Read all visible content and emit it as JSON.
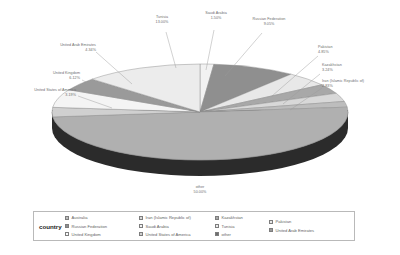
{
  "chart_data": {
    "type": "pie",
    "title": "",
    "legend_title": "country",
    "legend_position": "bottom",
    "three_d": true,
    "categories": [
      "Saudi Arabia",
      "Russian Federation",
      "Pakistan",
      "Kazakhstan",
      "Iran (Islamic Republic of)",
      "Australia",
      "other",
      "United States of America",
      "United Kingdom",
      "United Arab Emirates",
      "Tunisia"
    ],
    "values": [
      1.5,
      9.05,
      4.85,
      3.24,
      2.83,
      1.93,
      50.0,
      3.19,
      6.12,
      4.34,
      13.0
    ],
    "value_format": "percent",
    "labels": [
      {
        "name": "Saudi Arabia",
        "pct": "1.50%",
        "value": 1.5
      },
      {
        "name": "Russian Federation",
        "pct": "9.05%",
        "value": 9.05
      },
      {
        "name": "Pakistan",
        "pct": "4.85%",
        "value": 4.85
      },
      {
        "name": "Kazakhstan",
        "pct": "3.24%",
        "value": 3.24
      },
      {
        "name": "Iran (Islamic Republic of)",
        "pct": "2.83%",
        "value": 2.83
      },
      {
        "name": "other",
        "pct": "50.00%",
        "value": 50.0
      },
      {
        "name": "United States of America",
        "pct": "3.19%",
        "value": 3.19
      },
      {
        "name": "United Kingdom",
        "pct": "6.12%",
        "value": 6.12
      },
      {
        "name": "United Arab Emirates",
        "pct": "4.34%",
        "value": 4.34
      },
      {
        "name": "Tunisia",
        "pct": "13.00%",
        "value": 13.0
      }
    ],
    "slice_colors": [
      "#f2f2f2",
      "#8f8f8f",
      "#e8e8e8",
      "#a8a8a8",
      "#d8d8d8",
      "#bdbdbd",
      "#b0b0b0",
      "#d0d0d0",
      "#f4f4f4",
      "#9a9a9a",
      "#ececec"
    ]
  },
  "legend": {
    "title": "country",
    "columns": [
      [
        {
          "label": "Australia",
          "swatch": "#bdbdbd"
        },
        {
          "label": "Russian Federation",
          "swatch": "#8f8f8f"
        },
        {
          "label": "United Kingdom",
          "swatch": "#fbfbfb"
        }
      ],
      [
        {
          "label": "Iran (Islamic Republic of)",
          "swatch": "#d8d8d8"
        },
        {
          "label": "Saudi Arabia",
          "swatch": "#f2f2f2"
        },
        {
          "label": "United States of America",
          "swatch": "#d0d0d0"
        }
      ],
      [
        {
          "label": "Kazakhstan",
          "swatch": "#a8a8a8"
        },
        {
          "label": "Tunisia",
          "swatch": "#ececec"
        },
        {
          "label": "other",
          "swatch": "#6e6e6e"
        }
      ],
      [
        {
          "label": "Pakistan",
          "swatch": "#e8e8e8"
        },
        {
          "label": "United Arab Emirates",
          "swatch": "#9a9a9a"
        }
      ]
    ]
  }
}
